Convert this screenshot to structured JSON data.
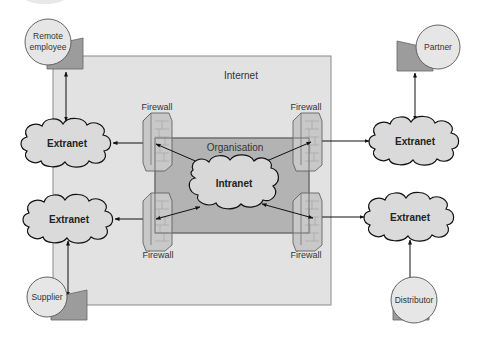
{
  "diagram": {
    "type": "network-topology",
    "zones": {
      "internet": {
        "label": "Internet",
        "fill": "#e2e2e2"
      },
      "organisation": {
        "label": "Organisation",
        "fill": "#b3b3b3"
      }
    },
    "central_network": {
      "label": "Intranet"
    },
    "extranets": [
      {
        "id": "extranet-top-left",
        "label": "Extranet"
      },
      {
        "id": "extranet-bottom-left",
        "label": "Extranet"
      },
      {
        "id": "extranet-top-right",
        "label": "Extranet"
      },
      {
        "id": "extranet-bottom-right",
        "label": "Extranet"
      }
    ],
    "firewalls": [
      {
        "id": "firewall-top-left",
        "label": "Firewall"
      },
      {
        "id": "firewall-top-right",
        "label": "Firewall"
      },
      {
        "id": "firewall-bottom-left",
        "label": "Firewall"
      },
      {
        "id": "firewall-bottom-right",
        "label": "Firewall"
      }
    ],
    "external_parties": [
      {
        "id": "remote-employee",
        "label_line1": "Remote",
        "label_line2": "employee"
      },
      {
        "id": "partner",
        "label": "Partner"
      },
      {
        "id": "supplier",
        "label": "Supplier"
      },
      {
        "id": "distributor",
        "label": "Distributor"
      }
    ],
    "connections": [
      [
        "Remote employee",
        "Extranet (top-left)"
      ],
      [
        "Partner",
        "Extranet (top-right)"
      ],
      [
        "Supplier",
        "Extranet (bottom-left)"
      ],
      [
        "Distributor",
        "Extranet (bottom-right)"
      ],
      [
        "Extranet (top-left)",
        "Firewall (top-left)"
      ],
      [
        "Extranet (bottom-left)",
        "Firewall (bottom-left)"
      ],
      [
        "Extranet (top-right)",
        "Firewall (top-right)"
      ],
      [
        "Extranet (bottom-right)",
        "Firewall (bottom-right)"
      ],
      [
        "Firewall (top-left)",
        "Intranet"
      ],
      [
        "Firewall (bottom-left)",
        "Intranet"
      ],
      [
        "Firewall (top-right)",
        "Intranet"
      ],
      [
        "Firewall (bottom-right)",
        "Intranet"
      ]
    ],
    "colors": {
      "internet_fill": "#e2e2e2",
      "organisation_fill": "#b3b3b3",
      "cloud_fill": "#dadada",
      "device_fill": "#9c9c9c",
      "party_circle_fill": "#e6e6e6",
      "stroke": "#1a1a1a"
    }
  }
}
